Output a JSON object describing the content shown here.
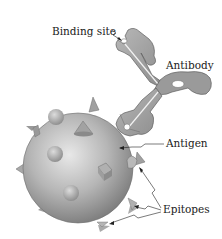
{
  "diagram": {
    "labels": {
      "binding_site": "Binding site",
      "antibody": "Antibody",
      "antigen": "Antigen",
      "epitopes": "Epitopes"
    },
    "colors": {
      "background": "#ffffff",
      "antigen_light": "#e6e6e6",
      "antigen_dark": "#8a8a8a",
      "antibody_fill": "#a8a8a8",
      "antibody_dark": "#7a7a7a",
      "outline": "#555555",
      "text": "#1a1a1a"
    }
  }
}
